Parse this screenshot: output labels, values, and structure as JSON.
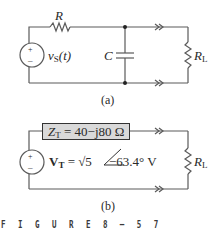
{
  "figure": {
    "caption": "FIGURE 8-57",
    "caption_display": "F I G U R E  8 – 5 7"
  },
  "circuit_a": {
    "label": "(a)",
    "source": {
      "name": "v",
      "sub": "S",
      "arg": "(t)",
      "plus": "+",
      "minus": "–"
    },
    "resistor": {
      "name": "R"
    },
    "capacitor": {
      "name": "C"
    },
    "load": {
      "name": "R",
      "sub": "L"
    }
  },
  "circuit_b": {
    "label": "(b)",
    "thevenin_impedance": {
      "name": "Z",
      "sub": "T",
      "value": " = 40−j80 Ω"
    },
    "thevenin_voltage": {
      "name": "V",
      "sub": "T",
      "value_prefix": " = √5",
      "angle": "−63.4°",
      "unit": " V",
      "plus": "+",
      "minus": "–"
    },
    "load": {
      "name": "R",
      "sub": "L"
    }
  },
  "colors": {
    "wire": "#555555",
    "box_fill": "#d9d9d9",
    "text": "#2a2a2a"
  }
}
